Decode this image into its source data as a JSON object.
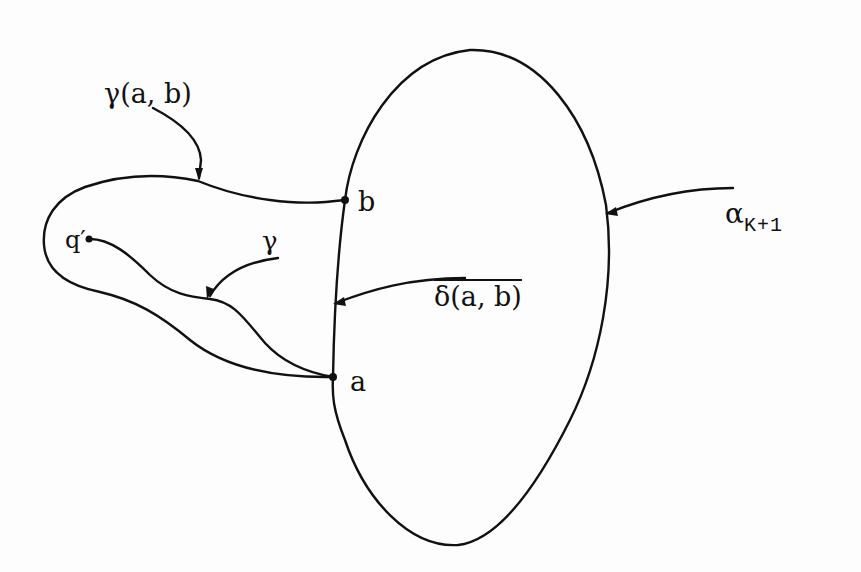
{
  "diagram": {
    "labels": {
      "gamma_ab": "γ(a, b)",
      "gamma": "γ",
      "delta_ab": "δ(a, b)",
      "alpha_main": "α",
      "alpha_sub": "K+1",
      "point_b": "b",
      "point_a": "a",
      "point_q": "q′"
    },
    "points": [
      {
        "name": "b",
        "x": 345,
        "y": 200
      },
      {
        "name": "a",
        "x": 333,
        "y": 377
      },
      {
        "name": "q′",
        "x": 88,
        "y": 239
      }
    ],
    "colors": {
      "ink": "#111111",
      "paper": "#fdfdfd"
    }
  }
}
